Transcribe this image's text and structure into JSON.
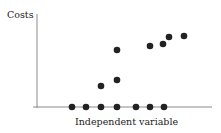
{
  "chart_data": {
    "type": "scatter",
    "title": "",
    "xlabel": "Independent variable",
    "ylabel": "Costs",
    "grid": false,
    "legend": null,
    "axis_ticks": "none",
    "points": [
      {
        "x": 1,
        "y": 0
      },
      {
        "x": 2,
        "y": 0
      },
      {
        "x": 3,
        "y": 0
      },
      {
        "x": 3,
        "y": 1
      },
      {
        "x": 4,
        "y": 0
      },
      {
        "x": 4,
        "y": 1.3
      },
      {
        "x": 4,
        "y": 2.8
      },
      {
        "x": 5,
        "y": 0
      },
      {
        "x": 5,
        "y": 3.0
      },
      {
        "x": 6,
        "y": 0
      },
      {
        "x": 6,
        "y": 3.1
      },
      {
        "x": 6.4,
        "y": 3.4
      },
      {
        "x": 7,
        "y": 0
      },
      {
        "x": 7.4,
        "y": 3.5
      }
    ],
    "pixel_points": [
      [
        72,
        107
      ],
      [
        86,
        107
      ],
      [
        101,
        107
      ],
      [
        117,
        107
      ],
      [
        136,
        107
      ],
      [
        150,
        107
      ],
      [
        164,
        107
      ],
      [
        101,
        86
      ],
      [
        117,
        80
      ],
      [
        117,
        50
      ],
      [
        150,
        46
      ],
      [
        163,
        44
      ],
      [
        169,
        37
      ],
      [
        184,
        36
      ]
    ],
    "colors": {
      "point": "#222222",
      "axis": "#888888",
      "text": "#222222"
    }
  }
}
